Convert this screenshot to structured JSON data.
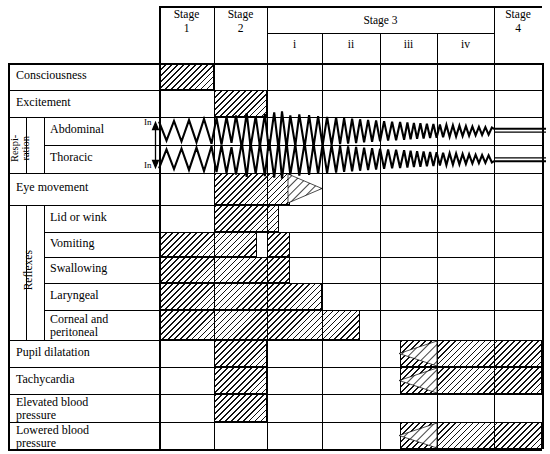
{
  "figure": {
    "type": "table"
  },
  "columns": {
    "stage1": {
      "label_line1": "Stage",
      "label_line2": "1",
      "x0": 159,
      "x1": 214
    },
    "stage2": {
      "label_line1": "Stage",
      "label_line2": "2",
      "x0": 214,
      "x1": 267
    },
    "stage3": {
      "label": "Stage 3",
      "x0": 267,
      "x1": 494,
      "planes": [
        {
          "label": "i",
          "x0": 267,
          "x1": 322
        },
        {
          "label": "ii",
          "x0": 322,
          "x1": 380
        },
        {
          "label": "iii",
          "x0": 380,
          "x1": 437
        },
        {
          "label": "iv",
          "x0": 437,
          "x1": 494
        }
      ]
    },
    "stage4": {
      "label_line1": "Stage",
      "label_line2": "4",
      "x0": 494,
      "x1": 542
    }
  },
  "group_labels": {
    "respiration": "Respi-\nration",
    "respiration_line1": "Respi-",
    "respiration_line2": "ration",
    "reflexes": "Reflexes"
  },
  "respiration_axis": {
    "top_label": "In",
    "bottom_label": "In"
  },
  "rows": [
    {
      "name": "consciousness",
      "label": "Consciousness",
      "y0": 63,
      "y1": 90,
      "indent": 0
    },
    {
      "name": "excitement",
      "label": "Excitement",
      "y0": 90,
      "y1": 117,
      "indent": 0
    },
    {
      "name": "abdominal",
      "label": "Abdominal",
      "y0": 117,
      "y1": 145,
      "indent": 1
    },
    {
      "name": "thoracic",
      "label": "Thoracic",
      "y0": 145,
      "y1": 173,
      "indent": 1
    },
    {
      "name": "eye-movement",
      "label": "Eye movement",
      "y0": 173,
      "y1": 205,
      "indent": 0
    },
    {
      "name": "lid-or-wink",
      "label": "Lid or wink",
      "y0": 205,
      "y1": 232,
      "indent": 1
    },
    {
      "name": "vomiting",
      "label": "Vomiting",
      "y0": 232,
      "y1": 257,
      "indent": 1
    },
    {
      "name": "swallowing",
      "label": "Swallowing",
      "y0": 257,
      "y1": 283,
      "indent": 1
    },
    {
      "name": "laryngeal",
      "label": "Laryngeal",
      "y0": 283,
      "y1": 310,
      "indent": 1
    },
    {
      "name": "corneal-peritoneal",
      "label": "Corneal and\nperitoneal",
      "label_line1": "Corneal and",
      "label_line2": "peritoneal",
      "y0": 310,
      "y1": 340,
      "indent": 1
    },
    {
      "name": "pupil-dilatation",
      "label": "Pupil dilatation",
      "y0": 340,
      "y1": 367,
      "indent": 0
    },
    {
      "name": "tachycardia",
      "label": "Tachycardia",
      "y0": 367,
      "y1": 394,
      "indent": 0
    },
    {
      "name": "elevated-bp",
      "label": "Elevated blood\npressure",
      "label_line1": "Elevated blood",
      "label_line2": "pressure",
      "y0": 394,
      "y1": 422,
      "indent": 0
    },
    {
      "name": "lowered-bp",
      "label": "Lowered blood\npressure",
      "label_line1": "Lowered blood",
      "label_line2": "pressure",
      "y0": 422,
      "y1": 449,
      "indent": 0
    }
  ],
  "chart_data": {
    "type": "table",
    "categories": [
      "Stage 1",
      "Stage 2",
      "Stage 3 i",
      "Stage 3 ii",
      "Stage 3 iii",
      "Stage 3 iv",
      "Stage 4"
    ],
    "rows": [
      {
        "label": "Consciousness",
        "spans": [
          [
            159,
            214
          ]
        ]
      },
      {
        "label": "Excitement",
        "spans": [
          [
            214,
            267
          ]
        ]
      },
      {
        "label": "Abdominal",
        "spans": []
      },
      {
        "label": "Thoracic",
        "spans": []
      },
      {
        "label": "Eye movement",
        "spans": [
          [
            214,
            290
          ]
        ],
        "taper_to": 322
      },
      {
        "label": "Lid or wink",
        "spans": [
          [
            214,
            279
          ]
        ]
      },
      {
        "label": "Vomiting",
        "spans": [
          [
            159,
            257
          ],
          [
            267,
            290
          ]
        ]
      },
      {
        "label": "Swallowing",
        "spans": [
          [
            159,
            290
          ]
        ]
      },
      {
        "label": "Laryngeal",
        "spans": [
          [
            159,
            322
          ]
        ]
      },
      {
        "label": "Corneal and peritoneal",
        "spans": [
          [
            159,
            360
          ]
        ]
      },
      {
        "label": "Pupil dilatation",
        "spans": [
          [
            214,
            267
          ],
          [
            400,
            542
          ]
        ],
        "arrow_from": 400
      },
      {
        "label": "Tachycardia",
        "spans": [
          [
            214,
            267
          ],
          [
            400,
            542
          ]
        ],
        "arrow_from": 400
      },
      {
        "label": "Elevated blood pressure",
        "spans": [
          [
            214,
            267
          ]
        ]
      },
      {
        "label": "Lowered blood pressure",
        "spans": [
          [
            400,
            542
          ]
        ],
        "arrow_from": 400
      }
    ],
    "respiration_trace": {
      "description": "Mirrored zigzag respiration waveform (abdominal upper, thoracic lower), amplitude grows through stage 2 into plane i then diminishes, flat line in stage 4",
      "x_start": 159,
      "x_flat": 494,
      "x_end": 546
    }
  }
}
